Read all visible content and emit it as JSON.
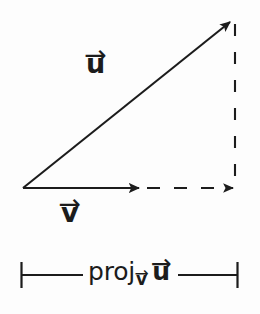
{
  "figure": {
    "background_color": "#fdfdfd",
    "stroke_color": "#1c1c1c",
    "width": 260,
    "height": 314
  },
  "labels": {
    "u_letter": "u",
    "u_accent": "→",
    "v_letter": "v",
    "v_accent": "→",
    "proj_word": "proj",
    "proj_sub_letter": "v",
    "proj_sub_accent": "→",
    "proj_arg_letter": "u",
    "proj_arg_accent": "→"
  },
  "geometry": {
    "origin": {
      "x": 23,
      "y": 188
    },
    "u_vector": {
      "from": {
        "x": 23,
        "y": 188
      },
      "to": {
        "x": 234,
        "y": 19
      },
      "style": "solid",
      "arrowhead": true
    },
    "v_vector": {
      "from": {
        "x": 23,
        "y": 188
      },
      "to": {
        "x": 145,
        "y": 188
      },
      "style": "solid",
      "arrowhead": true
    },
    "projection_extension": {
      "from": {
        "x": 145,
        "y": 188
      },
      "to": {
        "x": 240,
        "y": 188
      },
      "style": "dashed",
      "arrowhead": true
    },
    "drop_line": {
      "from": {
        "x": 235,
        "y": 22
      },
      "to": {
        "x": 235,
        "y": 185
      },
      "style": "dashed",
      "arrowhead": false
    },
    "measure_bracket": {
      "y": 275,
      "left_tick_x": 21,
      "right_tick_x": 238,
      "tick_half_height": 13,
      "left_segment": {
        "x1": 21,
        "x2": 83
      },
      "right_segment": {
        "x1": 178,
        "x2": 238
      }
    }
  }
}
